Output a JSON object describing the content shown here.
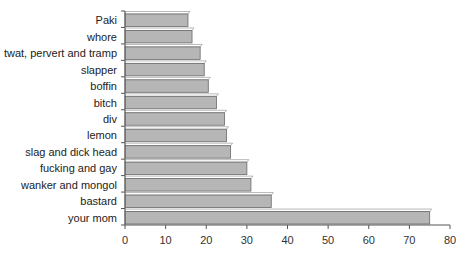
{
  "chart_data": {
    "type": "bar",
    "orientation": "horizontal",
    "style": "3d",
    "title": "",
    "xlabel": "",
    "ylabel": "",
    "categories": [
      "Paki",
      "whore",
      "twat, pervert and tramp",
      "slapper",
      "boffin",
      "bitch",
      "div",
      "lemon",
      "slag and dick head",
      "fucking and gay",
      "wanker and mongol",
      "bastard",
      "your mom"
    ],
    "values": [
      15.5,
      16.5,
      18.5,
      19.5,
      20.5,
      22.5,
      24.5,
      25,
      26,
      30,
      31,
      36,
      75
    ],
    "xlim": [
      0,
      80
    ],
    "xticks": [
      0,
      10,
      20,
      30,
      40,
      50,
      60,
      70,
      80
    ],
    "grid": false,
    "legend": null,
    "colors": {
      "bar_fill": "#b6b6b6",
      "bar_top": "#ffffff",
      "outline": "#6a6a6a"
    }
  }
}
